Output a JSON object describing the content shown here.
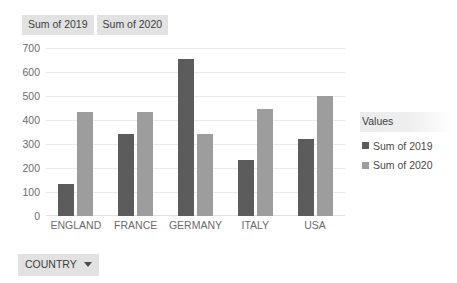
{
  "field_chips": [
    {
      "label": "Sum of 2019"
    },
    {
      "label": "Sum of 2020"
    }
  ],
  "legend": {
    "title": "Values",
    "items": [
      {
        "label": "Sum of 2019",
        "color": "#5c5c5c"
      },
      {
        "label": "Sum of 2020",
        "color": "#9d9d9d"
      }
    ]
  },
  "axis_field_button": {
    "label": "COUNTRY",
    "icon": "chevron-down-icon"
  },
  "chart_data": {
    "type": "bar",
    "title": "",
    "xlabel": "COUNTRY",
    "ylabel": "",
    "categories": [
      "ENGLAND",
      "FRANCE",
      "GERMANY",
      "ITALY",
      "USA"
    ],
    "series": [
      {
        "name": "Sum of 2019",
        "color": "#5c5c5c",
        "values": [
          133,
          340,
          655,
          235,
          320
        ]
      },
      {
        "name": "Sum of 2020",
        "color": "#9d9d9d",
        "values": [
          432,
          432,
          340,
          445,
          500
        ]
      }
    ],
    "ylim": [
      0,
      700
    ],
    "yticks": [
      700,
      600,
      500,
      400,
      300,
      200,
      100,
      0
    ],
    "ytick_labels": [
      "700",
      "600",
      "500",
      "400",
      "300",
      "200",
      "100",
      "0"
    ],
    "grid": true,
    "legend_position": "right"
  }
}
